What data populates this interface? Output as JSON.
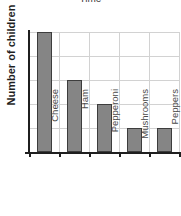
{
  "chart_data": {
    "type": "bar",
    "title": "Time",
    "xlabel": "",
    "ylabel": "Number of children",
    "categories": [
      "Cheese",
      "Ham",
      "Pepperoni",
      "Mushrooms",
      "Peppers"
    ],
    "values": [
      5,
      3,
      2,
      1,
      1
    ],
    "ylim": [
      0,
      5
    ],
    "ytick_labels": [],
    "gridlines": {
      "horizontal": true,
      "vertical": true,
      "horizontal_count": 5,
      "vertical_count": 5
    },
    "legend": null,
    "bar_color": "#858585",
    "bar_border_color": "#3d3d3d",
    "grid_color": "#d2d2d2",
    "axis_color": "#1f1f1f",
    "background": "#ffffff"
  },
  "axis": {
    "y_label": "Number of children",
    "tick_labels": {
      "t0": "Cheese",
      "t1": "Ham",
      "t2": "Pepperoni",
      "t3": "Mushrooms",
      "t4": "Peppers"
    }
  }
}
